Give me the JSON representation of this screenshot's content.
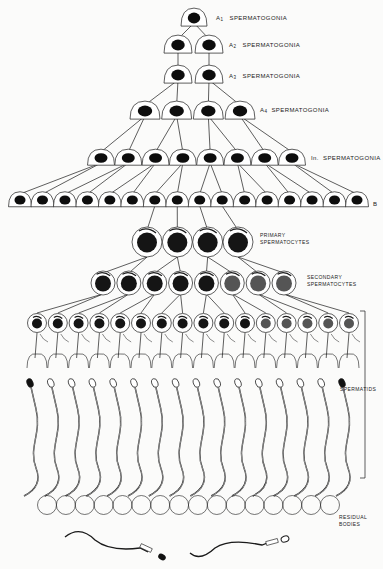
{
  "labels": {
    "a1": {
      "prefix": "A",
      "sub": "1",
      "text": "SPERMATOGONIA"
    },
    "a2": {
      "prefix": "A",
      "sub": "2",
      "text": "SPERMATOGONIA"
    },
    "a3": {
      "prefix": "A",
      "sub": "3",
      "text": "SPERMATOGONIA"
    },
    "a4": {
      "prefix": "A",
      "sub": "4",
      "text": "SPERMATOGONIA"
    },
    "in": {
      "prefix": "In.",
      "text": "SPERMATOGONIA"
    },
    "b": {
      "text": "B"
    },
    "primary": {
      "line1": "PRIMARY",
      "line2": "SPERMATOCYTES"
    },
    "secondary": {
      "line1": "SECONDARY",
      "line2": "SPERMATOCYTES"
    },
    "spermatids": {
      "text": "SPERMATIDS"
    },
    "residual": {
      "line1": "RESIDUAL",
      "line2": "BODIES"
    }
  },
  "generations": [
    {
      "name": "A1 spermatogonia",
      "count": 1
    },
    {
      "name": "A2 spermatogonia",
      "count": 2
    },
    {
      "name": "A3 spermatogonia",
      "count": 2
    },
    {
      "name": "A4 spermatogonia",
      "count": 4
    },
    {
      "name": "In spermatogonia",
      "count": 8
    },
    {
      "name": "B spermatogonia",
      "count": 16
    },
    {
      "name": "Primary spermatocytes",
      "count": 4
    },
    {
      "name": "Secondary spermatocytes",
      "count": 8
    },
    {
      "name": "Spermatids",
      "count": 16
    },
    {
      "name": "Residual bodies",
      "count": 16
    },
    {
      "name": "Spermatozoa",
      "count": 2
    }
  ],
  "colors": {
    "ink": "#1a1a1a",
    "paper": "#fbfbfa",
    "nucleus": "#0d0d0d"
  }
}
